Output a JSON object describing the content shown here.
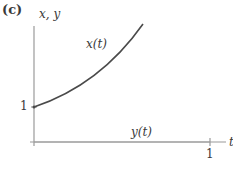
{
  "panel_label": "(c)",
  "axes": {
    "y_label": "x, y",
    "x_label": "t",
    "y_tick_label": "1",
    "x_tick_label": "1"
  },
  "curves": {
    "x_label": "x(t)",
    "y_label": "y(t)"
  },
  "colors": {
    "axis": "#9a9a9a",
    "curve": "#4a4a4a",
    "text": "#3a3a3a"
  }
}
